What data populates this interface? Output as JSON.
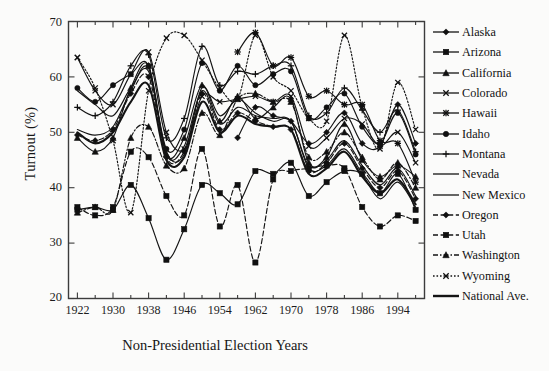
{
  "chart_data": {
    "type": "line",
    "title": "",
    "xlabel": "Non-Presidential Election Years",
    "ylabel": "Turnout (%)",
    "xlim": [
      1920,
      2000
    ],
    "ylim": [
      20,
      70
    ],
    "ytick_values": [
      20,
      30,
      40,
      50,
      60,
      70
    ],
    "ytick_labels": [
      "20",
      "30",
      "40",
      "50",
      "60",
      "70"
    ],
    "xtick_labels": [
      "1922",
      "1930",
      "1938",
      "1946",
      "1954",
      "1962",
      "1970",
      "1978",
      "1986",
      "1994"
    ],
    "xtick_values": [
      1922,
      1930,
      1938,
      1946,
      1954,
      1962,
      1970,
      1978,
      1986,
      1994
    ],
    "minor_xtick_step": 4,
    "grid": false,
    "legend_position": "right",
    "x": [
      1922,
      1926,
      1930,
      1934,
      1938,
      1942,
      1946,
      1950,
      1954,
      1958,
      1962,
      1966,
      1970,
      1974,
      1978,
      1982,
      1986,
      1990,
      1994,
      1998
    ],
    "series": [
      {
        "name": "Alaska",
        "marker": "diamond",
        "dash": "solid",
        "values": [
          null,
          null,
          null,
          null,
          null,
          null,
          null,
          null,
          null,
          49.0,
          54.5,
          53.0,
          52.0,
          48.0,
          50.0,
          53.5,
          48.0,
          47.5,
          55.0,
          48.0
        ]
      },
      {
        "name": "Arizona",
        "marker": "square",
        "dash": "solid",
        "values": [
          36.0,
          36.5,
          36.0,
          40.5,
          34.5,
          27.0,
          32.5,
          40.5,
          39.0,
          37.0,
          43.0,
          42.5,
          44.5,
          38.5,
          41.0,
          43.0,
          42.5,
          39.0,
          42.5,
          36.0
        ]
      },
      {
        "name": "California",
        "marker": "triangle",
        "dash": "solid",
        "values": [
          49.0,
          46.5,
          49.0,
          58.0,
          62.0,
          46.0,
          49.0,
          58.5,
          52.0,
          56.5,
          52.5,
          54.5,
          56.0,
          44.5,
          45.5,
          51.5,
          45.0,
          42.0,
          44.0,
          42.0
        ]
      },
      {
        "name": "Colorado",
        "marker": "x",
        "dash": "solid",
        "values": [
          63.5,
          57.5,
          55.0,
          60.5,
          64.5,
          50.0,
          47.0,
          56.5,
          55.5,
          56.0,
          56.5,
          55.5,
          56.5,
          47.5,
          49.0,
          52.5,
          51.5,
          47.5,
          50.0,
          44.5
        ]
      },
      {
        "name": "Hawaii",
        "marker": "star",
        "dash": "solid",
        "values": [
          null,
          null,
          null,
          null,
          null,
          null,
          null,
          null,
          null,
          64.5,
          68.0,
          62.0,
          63.5,
          56.5,
          57.5,
          55.0,
          55.0,
          48.5,
          48.0,
          41.0
        ]
      },
      {
        "name": "Idaho",
        "marker": "circle",
        "dash": "solid",
        "values": [
          58.0,
          55.5,
          58.5,
          60.5,
          62.0,
          47.0,
          50.5,
          62.5,
          57.5,
          62.0,
          58.5,
          60.5,
          61.0,
          52.5,
          54.5,
          57.0,
          51.0,
          48.0,
          53.5,
          46.0
        ]
      },
      {
        "name": "Montana",
        "marker": "plus",
        "dash": "solid",
        "values": [
          54.5,
          53.0,
          55.5,
          62.0,
          64.0,
          49.0,
          52.5,
          65.5,
          58.5,
          61.0,
          60.5,
          62.0,
          62.0,
          53.0,
          53.5,
          58.0,
          54.0,
          50.0,
          54.0,
          46.5
        ]
      },
      {
        "name": "Nevada",
        "marker": "none",
        "dash": "solid",
        "values": [
          57.5,
          55.0,
          53.0,
          58.0,
          61.0,
          46.5,
          46.0,
          58.0,
          53.0,
          56.0,
          53.5,
          52.0,
          52.0,
          43.5,
          44.0,
          47.0,
          42.5,
          38.0,
          41.0,
          36.5
        ]
      },
      {
        "name": "New Mexico",
        "marker": "none",
        "dash": "solid",
        "values": [
          50.5,
          49.5,
          51.0,
          57.5,
          61.5,
          46.0,
          47.5,
          57.5,
          51.5,
          54.5,
          53.0,
          52.5,
          52.0,
          44.0,
          45.0,
          48.5,
          44.0,
          40.5,
          43.5,
          38.5
        ]
      },
      {
        "name": "Oregon",
        "marker": "diamond",
        "dash": "dashed",
        "values": [
          49.5,
          48.5,
          50.5,
          57.0,
          60.0,
          45.5,
          46.5,
          57.0,
          50.5,
          53.5,
          52.0,
          51.0,
          50.5,
          43.0,
          44.5,
          48.0,
          43.5,
          40.0,
          43.0,
          38.0
        ]
      },
      {
        "name": "Utah",
        "marker": "square",
        "dash": "dashed",
        "values": [
          36.5,
          35.0,
          36.5,
          46.5,
          45.5,
          38.5,
          35.0,
          47.0,
          33.0,
          40.5,
          26.5,
          41.5,
          43.0,
          43.5,
          44.0,
          43.5,
          36.5,
          33.0,
          35.0,
          34.0
        ]
      },
      {
        "name": "Washington",
        "marker": "triangle",
        "dash": "dashdot",
        "values": [
          35.5,
          36.5,
          36.0,
          49.0,
          51.0,
          44.0,
          43.5,
          53.5,
          49.5,
          56.0,
          57.0,
          55.5,
          55.5,
          45.5,
          46.5,
          50.0,
          45.5,
          41.5,
          44.5,
          40.0
        ]
      },
      {
        "name": "Wyoming",
        "marker": "x",
        "dash": "dotted",
        "values": [
          63.5,
          58.0,
          48.5,
          35.5,
          57.5,
          67.0,
          67.5,
          63.0,
          58.0,
          56.0,
          67.5,
          60.0,
          57.5,
          52.5,
          52.0,
          67.5,
          54.5,
          47.0,
          59.0,
          50.5
        ]
      },
      {
        "name": "National Ave.",
        "marker": "none",
        "dash": "solid-thick",
        "values": [
          50.0,
          48.0,
          50.0,
          55.5,
          58.5,
          45.0,
          45.5,
          55.5,
          50.0,
          53.0,
          51.5,
          51.0,
          50.5,
          42.5,
          43.5,
          46.5,
          42.0,
          39.0,
          41.5,
          37.0
        ]
      }
    ]
  },
  "axes": {
    "ylabel": "Turnout (%)",
    "xlabel": "Non-Presidential Election Years",
    "yticks": [
      "70",
      "60",
      "50",
      "40",
      "30",
      "20"
    ],
    "xticks": [
      "1922",
      "1930",
      "1938",
      "1946",
      "1954",
      "1962",
      "1970",
      "1978",
      "1986",
      "1994"
    ]
  },
  "legend": {
    "items": [
      {
        "label": "Alaska",
        "marker": "diamond-marker",
        "dash": "solid"
      },
      {
        "label": "Arizona",
        "marker": "square-marker",
        "dash": "solid"
      },
      {
        "label": "California",
        "marker": "triangle-marker",
        "dash": "solid"
      },
      {
        "label": "Colorado",
        "marker": "x-marker",
        "dash": "solid"
      },
      {
        "label": "Hawaii",
        "marker": "star-marker",
        "dash": "solid"
      },
      {
        "label": "Idaho",
        "marker": "circle-marker",
        "dash": "solid"
      },
      {
        "label": "Montana",
        "marker": "plus-marker",
        "dash": "solid"
      },
      {
        "label": "Nevada",
        "marker": "none",
        "dash": "solid"
      },
      {
        "label": "New Mexico",
        "marker": "none",
        "dash": "solid"
      },
      {
        "label": "Oregon",
        "marker": "diamond-marker",
        "dash": "dashed"
      },
      {
        "label": "Utah",
        "marker": "square-marker",
        "dash": "dashed"
      },
      {
        "label": "Washington",
        "marker": "triangle-marker",
        "dash": "dashdot"
      },
      {
        "label": "Wyoming",
        "marker": "x-marker",
        "dash": "dotted"
      },
      {
        "label": "National Ave.",
        "marker": "none",
        "dash": "solid-thick"
      }
    ]
  },
  "colors": {
    "line": "#141414",
    "axis": "#3a3a3a",
    "background": "#fbfbfa",
    "text": "#161616"
  }
}
